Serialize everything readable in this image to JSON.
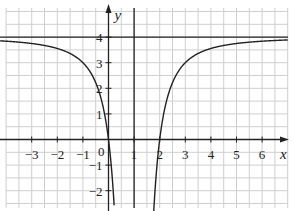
{
  "chart_data": {
    "type": "line",
    "title": "",
    "xlabel": "x",
    "ylabel": "y",
    "function": "y = 4 - 4/(x-1)^2",
    "xlim": [
      -4.2,
      7.2
    ],
    "ylim": [
      -2.7,
      5.4
    ],
    "grid": true,
    "grid_step": 0.5,
    "x_ticks": [
      -3,
      -2,
      -1,
      1,
      2,
      3,
      4,
      5,
      6
    ],
    "x_tick_labels": [
      "−3",
      "−2",
      "−1",
      "1",
      "2",
      "3",
      "4",
      "5",
      "6"
    ],
    "y_ticks": [
      -2,
      -1,
      1,
      2,
      3,
      4
    ],
    "y_tick_labels": [
      "−2",
      "−1",
      "1",
      "2",
      "3",
      "4"
    ],
    "origin_label": "0",
    "asymptotes": {
      "vertical_x": 1,
      "horizontal_y": 4
    },
    "series": [
      {
        "name": "left branch",
        "x": [
          -4,
          -3,
          -2,
          -1,
          -0.5,
          0,
          0.2
        ],
        "y": [
          3.84,
          3.75,
          3.56,
          3.0,
          2.22,
          0.0,
          -2.25
        ]
      },
      {
        "name": "right branch",
        "x": [
          1.8,
          2,
          2.5,
          3,
          4,
          5,
          6,
          7
        ],
        "y": [
          -2.25,
          0.0,
          2.22,
          3.0,
          3.56,
          3.75,
          3.84,
          3.89
        ]
      }
    ],
    "intercepts": {
      "x": [
        0,
        2
      ],
      "y": 0
    }
  },
  "colors": {
    "grid": "#cfcfcf",
    "axis": "#222222",
    "curve": "#222222",
    "background": "#ffffff"
  }
}
